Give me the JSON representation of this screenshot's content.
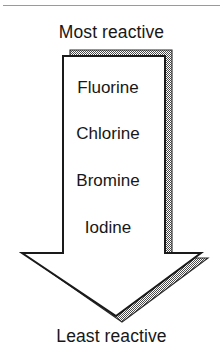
{
  "figure": {
    "title_top": "Most reactive",
    "title_bottom": "Least reactive",
    "elements": [
      {
        "name": "Fluorine"
      },
      {
        "name": "Chlorine"
      },
      {
        "name": "Bromine"
      },
      {
        "name": "Iodine"
      }
    ],
    "colors": {
      "ink": "#171717",
      "outline": "#1a1a1a",
      "shadow": "#808080",
      "background": "#ffffff",
      "rule": "#9a9a9a"
    },
    "arrow": {
      "direction": "down",
      "meaning": "reactivity decreases from top to bottom"
    }
  }
}
